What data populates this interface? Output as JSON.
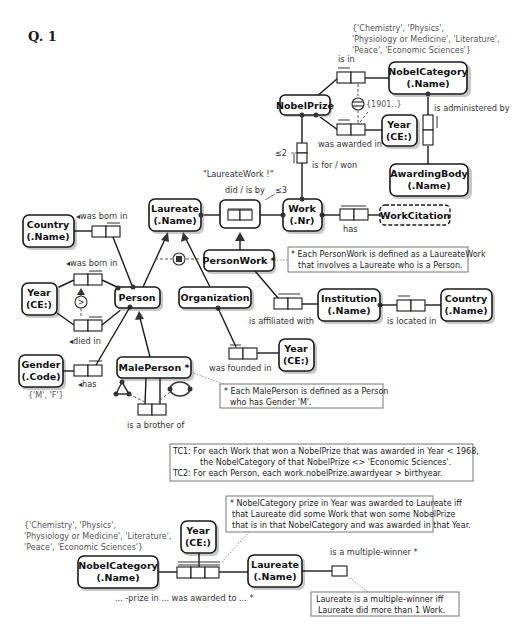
{
  "title": "Q. 1",
  "entities": {
    "nobel_category_top": {
      "line1": "NobelCategory",
      "line2": "(.Name)"
    },
    "nobel_prize": {
      "line1": "NobelPrize"
    },
    "year_award": {
      "line1": "Year",
      "line2": "(CE:)"
    },
    "awarding_body": {
      "line1": "AwardingBody",
      "line2": "(.Name)"
    },
    "laureate": {
      "line1": "Laureate",
      "line2": "(.Name)"
    },
    "work": {
      "line1": "Work",
      "line2": "(.Nr)"
    },
    "work_citation": {
      "line1": "WorkCitation"
    },
    "country_birth": {
      "line1": "Country",
      "line2": "(.Name)"
    },
    "year_birth": {
      "line1": "Year",
      "line2": "(CE:)"
    },
    "person": {
      "line1": "Person"
    },
    "organization": {
      "line1": "Organization"
    },
    "person_work": {
      "line1": "PersonWork *"
    },
    "institution": {
      "line1": "Institution",
      "line2": "(.Name)"
    },
    "country_inst": {
      "line1": "Country",
      "line2": "(.Name)"
    },
    "year_founded": {
      "line1": "Year",
      "line2": "(CE:)"
    },
    "gender": {
      "line1": "Gender",
      "line2": "(.Code)"
    },
    "male_person": {
      "line1": "MalePerson *"
    },
    "nobel_category_bottom": {
      "line1": "NobelCategory",
      "line2": "(.Name)"
    },
    "year_bottom": {
      "line1": "Year",
      "line2": "(CE:)"
    },
    "laureate_bottom": {
      "line1": "Laureate",
      "line2": "(.Name)"
    }
  },
  "value_constraints": {
    "category_top": [
      "{'Chemistry', 'Physics',",
      "'Physiology or Medicine', 'Literature',",
      "'Peace', 'Economic Sciences'}"
    ],
    "year_min": "{1901..}",
    "gender": "{'M', 'F'}",
    "category_bottom": [
      "{'Chemistry', 'Physics',",
      "'Physiology or Medicine', 'Literature',",
      "'Peace', 'Economic Sciences'}"
    ]
  },
  "fact_labels": {
    "is_in": "is in",
    "was_awarded_in": "was awarded in",
    "is_administered_by": "is administered by",
    "is_for_won": "is for / won",
    "le2": "≤2",
    "laureate_work_name": "\"LaureateWork !\"",
    "did_is_by": "did / is by",
    "le3": "≤3",
    "has_citation": "has",
    "was_born_in_country": "◂was born in",
    "was_born_in_year": "◂was born in",
    "died_in": "◂died in",
    "has_gender": "◂has",
    "is_affiliated_with": "is affiliated with",
    "is_located_in": "is located in",
    "was_founded_in": "was founded in",
    "is_a_brother_of": "is a brother of",
    "prize_awarded": "... -prize in ... was awarded to ... *",
    "is_multiple_winner": "is a multiple-winner *"
  },
  "notes": {
    "person_work": [
      "* Each PersonWork is defined as a LaureateWork",
      "that involves a Laureate who is a Person."
    ],
    "male_person": [
      "* Each MalePerson is defined as a Person",
      "who has Gender 'M'."
    ],
    "tc": [
      "TC1: For each Work that won a NobelPrize that was awarded in Year < 1968,",
      "the NobelCategory of that NobelPrize  <> 'Economic Sciences'.",
      "TC2:  For each Person, each work.nobelPrize.awardyear > birthyear."
    ],
    "prize_derivation": [
      "* NobelCategory prize in Year was awarded to Laureate iff",
      "that Laureate did some Work that won some NobelPrize",
      "that is in that NobelCategory and was awarded in that Year."
    ],
    "multiple_winner": [
      "Laureate is a multiple-winner iff",
      "Laureate did more than 1 Work."
    ]
  }
}
